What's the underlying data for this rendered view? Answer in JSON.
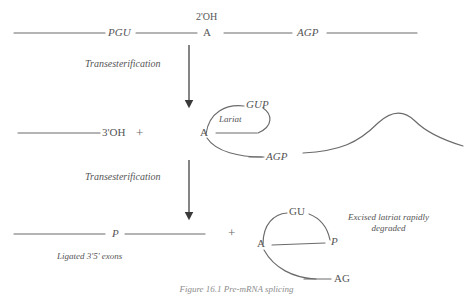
{
  "figure": {
    "domain": "diagram",
    "bottom_caption": "Figure 16.1  Pre-mRNA splicing",
    "line_color": "#6b6b6b",
    "text_color": "#555555",
    "background": "#ffffff"
  },
  "stage_one": {
    "name": "precursor-pre-mrna",
    "left_exon_label": "PGU",
    "branch_point_label": "A",
    "branch_hydroxyl_label": "2'OH",
    "right_exon_label": "AGP"
  },
  "arrow_one": {
    "label": "Transesterification"
  },
  "stage_two": {
    "name": "first-transesterification-products",
    "free_exon_label": "3'OH",
    "plus_label": "+",
    "lariat_top_label": "GUP",
    "lariat_inner_label": "Lariat",
    "lariat_branch_label": "A",
    "lariat_bottom_label": "AGP"
  },
  "arrow_two": {
    "label": "Transesterification"
  },
  "stage_three": {
    "name": "second-transesterification-products",
    "ligated_junction_label": "P",
    "ligated_caption": "Ligated 3'5' exons",
    "plus_label": "+",
    "lariat_top_label": "GU",
    "lariat_right_label": "P",
    "lariat_branch_label": "A",
    "lariat_tail_label": "AG",
    "degradation_note_line1": "Excised latriat rapidly",
    "degradation_note_line2": "degraded"
  }
}
